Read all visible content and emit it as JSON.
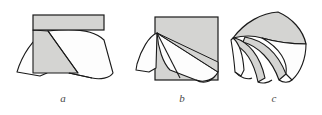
{
  "figure": {
    "caption_labels": [
      "a",
      "b",
      "c"
    ],
    "background_color": "#ffffff",
    "stroke_color": "#1a1a1a",
    "fill_gray": "#d4d4d2",
    "fill_white": "#fdfdfd",
    "panels": [
      {
        "id": "a",
        "label": "a",
        "label_x": 63,
        "label_y": 97,
        "description": "flat sheet with rectangular strip on top, two downward draping flaps",
        "shapes": {
          "top_rectangle": {
            "x": 33,
            "y": 15,
            "width": 71,
            "height": 15,
            "fill": "#d4d4d2"
          },
          "gray_wedge_points": "33,30 33,73 78,73 76,31",
          "apex_x": 48,
          "apex_y": 31
        }
      },
      {
        "id": "b",
        "label": "b",
        "label_x": 182,
        "label_y": 97,
        "description": "square sheet with corner pulled to left apex forming a cone-like fold",
        "shapes": {
          "square": {
            "x": 155,
            "y": 17,
            "width": 63,
            "height": 63,
            "fill": "#d4d4d2"
          },
          "apex_x": 157,
          "apex_y": 33
        }
      },
      {
        "id": "c",
        "label": "c",
        "label_x": 274,
        "label_y": 97,
        "description": "fully crumpled / multiply folded sheet with three curved ruled lobes",
        "shapes": {
          "bounds": {
            "x": 232,
            "y": 12,
            "width": 76,
            "height": 70
          }
        }
      }
    ]
  }
}
